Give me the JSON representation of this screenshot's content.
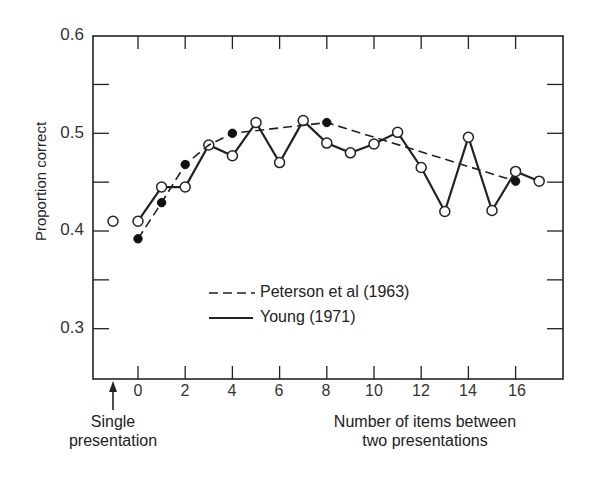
{
  "chart_data": {
    "type": "line",
    "title": "",
    "xlabel": "Number of items between two presentations",
    "xlabel_lines": [
      "Number of items between",
      "two presentations"
    ],
    "ylabel": "Proportion correct",
    "xlim": [
      -1.9,
      18
    ],
    "ylim": [
      0.25,
      0.6
    ],
    "x_ticks": [
      0,
      2,
      4,
      6,
      8,
      10,
      12,
      14,
      16
    ],
    "x_tick_labels": [
      "0",
      "2",
      "4",
      "6",
      "8",
      "10",
      "12",
      "14",
      "16"
    ],
    "y_ticks": [
      0.3,
      0.4,
      0.5,
      0.6
    ],
    "y_tick_labels": [
      "0.3",
      "0.4",
      "0.5",
      "0.6"
    ],
    "y_minor_ticks": [
      0.35,
      0.45,
      0.55
    ],
    "grid": false,
    "legend_position": "lower center inside",
    "annotations": [
      {
        "text_lines": [
          "Single",
          "presentation"
        ],
        "x": -1,
        "arrow": "up",
        "point_value": 0.41
      }
    ],
    "single_presentation": {
      "x": -1,
      "y": 0.41,
      "marker": "open-circle"
    },
    "series": [
      {
        "name": "Peterson et al (1963)",
        "style": "dashed",
        "marker": "filled-circle",
        "x": [
          0,
          1,
          2,
          3,
          4,
          8,
          16
        ],
        "values": [
          0.392,
          0.429,
          0.468,
          0.488,
          0.5,
          0.511,
          0.451
        ],
        "marker_at": [
          0,
          1,
          2,
          4,
          8,
          16
        ]
      },
      {
        "name": "Young (1971)",
        "style": "solid",
        "marker": "open-circle",
        "x": [
          0,
          1,
          2,
          3,
          4,
          5,
          6,
          7,
          8,
          9,
          10,
          11,
          12,
          13,
          14,
          15,
          16,
          17
        ],
        "values": [
          0.41,
          0.445,
          0.445,
          0.488,
          0.477,
          0.511,
          0.47,
          0.513,
          0.49,
          0.48,
          0.489,
          0.501,
          0.465,
          0.42,
          0.496,
          0.421,
          0.461,
          0.451
        ]
      }
    ]
  },
  "legend": {
    "peterson_label": "Peterson et al (1963)",
    "young_label": "Young (1971)"
  },
  "axis": {
    "ylabel": "Proportion correct",
    "xlabel_line1": "Number of items between",
    "xlabel_line2": "two presentations",
    "single_line1": "Single",
    "single_line2": "presentation"
  }
}
